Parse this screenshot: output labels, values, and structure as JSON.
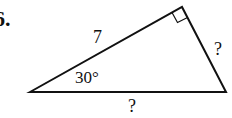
{
  "problem": {
    "number": "6.",
    "hypotenuse_label": "?",
    "side_given": "7",
    "side_unknown": "?",
    "angle_label": "30°"
  },
  "colors": {
    "stroke": "#111111",
    "background": "#ffffff"
  }
}
